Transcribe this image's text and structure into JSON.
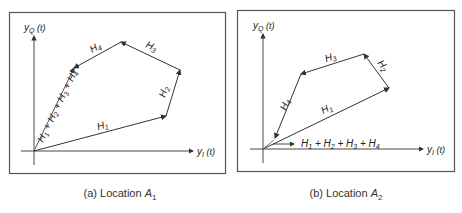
{
  "figure": {
    "panels": [
      {
        "id": "a",
        "caption_prefix": "(a) Location ",
        "caption_var": "A",
        "caption_sub": "1",
        "y_axis_label": "yQ(t)",
        "x_axis_label": "yI(t)",
        "vectors": [
          {
            "label": "H1"
          },
          {
            "label": "H2"
          },
          {
            "label": "H3"
          },
          {
            "label": "H4"
          },
          {
            "label": "H1 + H2 + H3 + H4"
          }
        ]
      },
      {
        "id": "b",
        "caption_prefix": "(b) Location ",
        "caption_var": "A",
        "caption_sub": "2",
        "y_axis_label": "yQ(t)",
        "x_axis_label": "yI(t)",
        "vectors": [
          {
            "label": "H1"
          },
          {
            "label": "H2"
          },
          {
            "label": "H3"
          },
          {
            "label": "H4"
          },
          {
            "label": "H1 + H2 + H3 + H4"
          }
        ]
      }
    ],
    "colors": {
      "frame": "#555555",
      "line": "#333333",
      "text": "#222222"
    }
  }
}
